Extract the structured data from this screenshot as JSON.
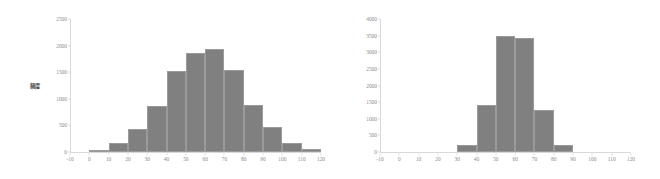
{
  "figure": {
    "background_color": "#ffffff",
    "bar_color": "#808080",
    "axis_color": "#d9d9d9",
    "tick_label_color": "#8a8a8a"
  },
  "chart_data": [
    {
      "id": "left-histogram",
      "type": "bar",
      "title": "",
      "xlabel": "",
      "ylabel": "頻度",
      "xlim": [
        -10,
        120
      ],
      "ylim": [
        0,
        2500
      ],
      "grid": false,
      "legend": null,
      "bin_width": 10,
      "xticks": [
        -10,
        0,
        10,
        20,
        30,
        40,
        50,
        60,
        70,
        80,
        90,
        100,
        110,
        120
      ],
      "yticks": [
        0,
        500,
        1000,
        1500,
        2000,
        2500
      ],
      "xtick_labels": [
        "-10",
        "0",
        "10",
        "20",
        "30",
        "40",
        "50",
        "60",
        "70",
        "80",
        "90",
        "100",
        "110",
        "120"
      ],
      "ytick_labels": [
        "0",
        "500",
        "1000",
        "1500",
        "2000",
        "2500"
      ],
      "bin_starts": [
        -10,
        0,
        10,
        20,
        30,
        40,
        50,
        60,
        70,
        80,
        90,
        100,
        110
      ],
      "categories": [
        "-10–0",
        "0–10",
        "10–20",
        "20–30",
        "30–40",
        "40–50",
        "50–60",
        "60–70",
        "70–80",
        "80–90",
        "90–100",
        "100–110",
        "110–120"
      ],
      "values": [
        0,
        40,
        165,
        440,
        865,
        1525,
        1870,
        1940,
        1540,
        885,
        465,
        175,
        50
      ]
    },
    {
      "id": "right-histogram",
      "type": "bar",
      "title": "",
      "xlabel": "",
      "ylabel": "",
      "xlim": [
        -10,
        120
      ],
      "ylim": [
        0,
        4000
      ],
      "grid": false,
      "legend": null,
      "bin_width": 10,
      "xticks": [
        -10,
        0,
        10,
        20,
        30,
        40,
        50,
        60,
        70,
        80,
        90,
        100,
        110,
        120
      ],
      "yticks": [
        0,
        500,
        1000,
        1500,
        2000,
        2500,
        3000,
        3500,
        4000
      ],
      "xtick_labels": [
        "-10",
        "0",
        "10",
        "20",
        "30",
        "40",
        "50",
        "60",
        "70",
        "80",
        "90",
        "100",
        "110",
        "120"
      ],
      "ytick_labels": [
        "0",
        "500",
        "1000",
        "1500",
        "2000",
        "2500",
        "3000",
        "3500",
        "4000"
      ],
      "bin_starts": [
        -10,
        0,
        10,
        20,
        30,
        40,
        50,
        60,
        70,
        80,
        90,
        100,
        110
      ],
      "categories": [
        "-10–0",
        "0–10",
        "10–20",
        "20–30",
        "30–40",
        "40–50",
        "50–60",
        "60–70",
        "70–80",
        "80–90",
        "90–100",
        "100–110",
        "110–120"
      ],
      "values": [
        0,
        0,
        0,
        0,
        200,
        1400,
        3500,
        3440,
        1265,
        200,
        0,
        0,
        0
      ]
    }
  ]
}
